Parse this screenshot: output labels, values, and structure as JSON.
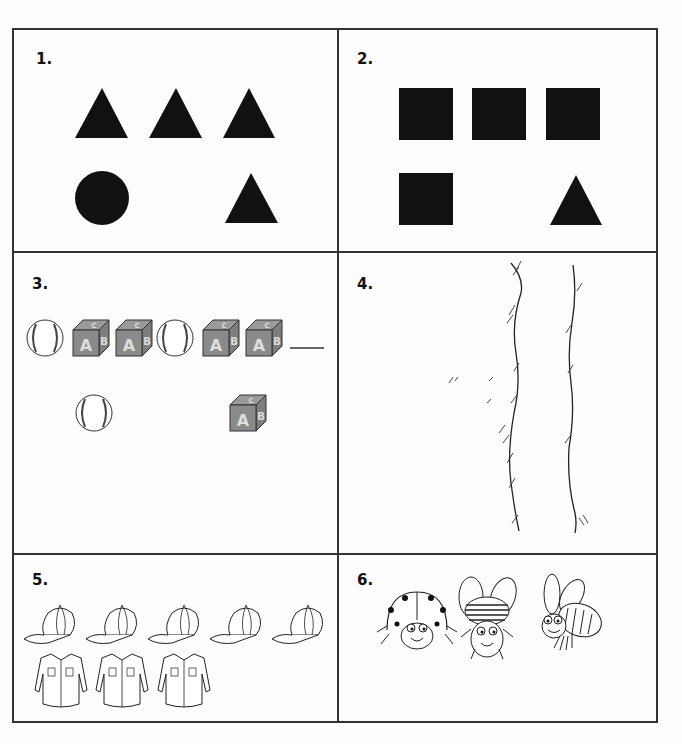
{
  "worksheet": {
    "panels": [
      {
        "number": "1.",
        "description": "Row: triangle, triangle, triangle. Next row: circle, (blank), triangle",
        "row1": [
          "triangle",
          "triangle",
          "triangle"
        ],
        "row2": [
          "circle",
          "triangle"
        ]
      },
      {
        "number": "2.",
        "description": "Row: square, square, square. Next row: square, (blank), triangle",
        "row1": [
          "square",
          "square",
          "square"
        ],
        "row2": [
          "square",
          "triangle"
        ]
      },
      {
        "number": "3.",
        "description": "Pattern: baseball, block, block, baseball, block, block, ___",
        "row1": [
          "baseball",
          "abc-block",
          "abc-block",
          "baseball",
          "abc-block",
          "abc-block"
        ],
        "blank": "___",
        "choices": [
          "baseball",
          "abc-block"
        ]
      },
      {
        "number": "4.",
        "description": "Two wavy vertical lines with grass tufts"
      },
      {
        "number": "5.",
        "description": "5 caps and 3 shirts",
        "row1": [
          "cap",
          "cap",
          "cap",
          "cap",
          "cap"
        ],
        "row2": [
          "shirt",
          "shirt",
          "shirt"
        ]
      },
      {
        "number": "6.",
        "description": "Ladybug, beetle, bee",
        "row1": [
          "ladybug",
          "beetle",
          "bee"
        ]
      }
    ]
  },
  "colors": {
    "ink": "#111111",
    "border": "#333333",
    "block": "#8a8a8a",
    "paper": "#fdfdfd"
  }
}
